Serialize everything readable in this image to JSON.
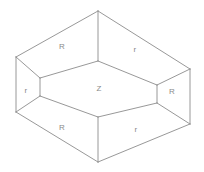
{
  "figure": {
    "background_color": "#ffffff",
    "line_color": "#8c8c8c",
    "label_color": "#8a8a8a",
    "labels": {
      "top_left_face": "R",
      "top_right_face": "r",
      "left_face": "r",
      "center_face": "Z",
      "right_face": "R",
      "bottom_left_face": "R",
      "bottom_right_face": "r"
    },
    "label_positions": {
      "top_left_face": {
        "x": 62,
        "y": 47
      },
      "top_right_face": {
        "x": 135,
        "y": 50
      },
      "left_face": {
        "x": 26,
        "y": 91
      },
      "center_face": {
        "x": 99,
        "y": 89
      },
      "right_face": {
        "x": 172,
        "y": 92
      },
      "bottom_left_face": {
        "x": 62,
        "y": 128
      },
      "bottom_right_face": {
        "x": 136,
        "y": 130
      }
    },
    "vertices": {
      "outer_top": {
        "x": 98,
        "y": 11
      },
      "outer_left": {
        "x": 16,
        "y": 57
      },
      "outer_right": {
        "x": 190,
        "y": 69
      },
      "outer_bottom": {
        "x": 98,
        "y": 118
      },
      "outer_left_bottom": {
        "x": 16,
        "y": 112
      },
      "outer_right_bottom": {
        "x": 190,
        "y": 124
      },
      "outer_bottom_apex": {
        "x": 98,
        "y": 162
      },
      "inner_top": {
        "x": 98,
        "y": 61
      },
      "inner_left": {
        "x": 40,
        "y": 78
      },
      "inner_right": {
        "x": 157,
        "y": 85
      },
      "inner_bottom": {
        "x": 98,
        "y": 117
      },
      "inner_left_low": {
        "x": 40,
        "y": 96
      },
      "inner_right_low": {
        "x": 157,
        "y": 103
      }
    }
  }
}
